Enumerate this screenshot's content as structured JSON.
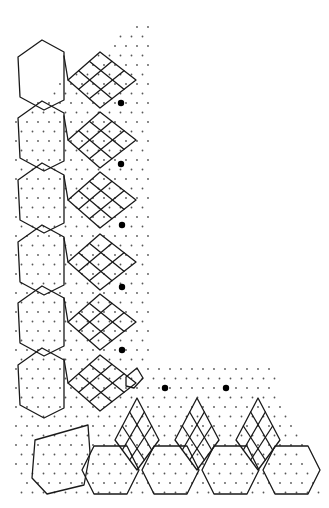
{
  "diagram": {
    "type": "lace-pricking-pattern",
    "colors": {
      "background": "#ffffff",
      "line": "#1a1a1a",
      "dot": "#555555",
      "pin": "#000000"
    },
    "pins": [
      {
        "x": 121,
        "y": 103
      },
      {
        "x": 121,
        "y": 164
      },
      {
        "x": 122,
        "y": 225
      },
      {
        "x": 122,
        "y": 287
      },
      {
        "x": 122,
        "y": 350
      },
      {
        "x": 165,
        "y": 388
      },
      {
        "x": 226,
        "y": 388
      }
    ],
    "vertical_units": [
      {
        "hex_top": 52,
        "fan_cy": 80
      },
      {
        "hex_top": 113,
        "fan_cy": 140
      },
      {
        "hex_top": 175,
        "fan_cy": 200
      },
      {
        "hex_top": 237,
        "fan_cy": 262
      },
      {
        "hex_top": 298,
        "fan_cy": 322
      },
      {
        "hex_top": 360,
        "fan_cy": 383
      }
    ],
    "horizontal_units": [
      {
        "hex_cx": 115,
        "fan_cx": 137
      },
      {
        "hex_cx": 175,
        "fan_cx": 197
      },
      {
        "hex_cx": 235,
        "fan_cx": 258
      },
      {
        "hex_cx": 296
      }
    ]
  }
}
